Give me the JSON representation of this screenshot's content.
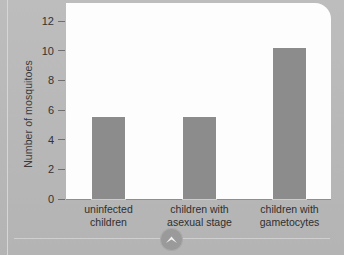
{
  "chart_data": {
    "type": "bar",
    "title": "",
    "xlabel": "",
    "ylabel": "Number of mosquitoes",
    "ylim": [
      0,
      13
    ],
    "yticks": [
      "0",
      "2",
      "4",
      "6",
      "8",
      "10",
      "12"
    ],
    "ytick_values": [
      0,
      2,
      4,
      6,
      8,
      10,
      12
    ],
    "grid": false,
    "legend": "none",
    "categories": [
      "uninfected children",
      "children with asexual stage",
      "children with gametocytes"
    ],
    "category_lines": [
      [
        "uninfected",
        "children"
      ],
      [
        "children with",
        "asexual stage"
      ],
      [
        "children with",
        "gametocytes"
      ]
    ],
    "values": [
      5.5,
      5.5,
      10.2
    ],
    "bar_color": "#8c8c8c",
    "plot_background": "#fdfdfd",
    "page_background": "#b9b9b9",
    "axis_color": "#8e8e8e"
  },
  "footer": {
    "scroll_up_icon": "chevron-up-icon"
  }
}
